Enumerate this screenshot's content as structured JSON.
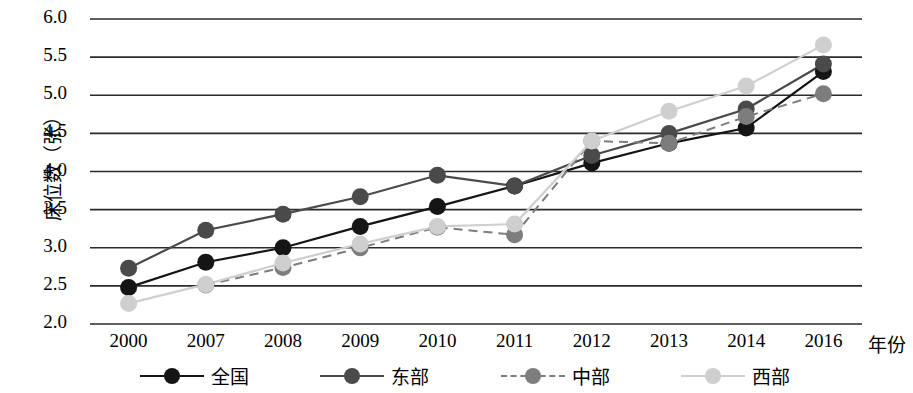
{
  "chart_data": {
    "type": "line",
    "title": "",
    "xlabel": "年份",
    "ylabel": "床位数（张）",
    "categories": [
      "2000",
      "2007",
      "2008",
      "2009",
      "2010",
      "2011",
      "2012",
      "2013",
      "2014",
      "2016"
    ],
    "ylim": [
      2.0,
      6.0
    ],
    "yticks": [
      "2.0",
      "2.5",
      "3.0",
      "3.5",
      "4.0",
      "4.5",
      "5.0",
      "5.5",
      "6.0"
    ],
    "grid": "horizontal",
    "legend_position": "bottom",
    "series": [
      {
        "name": "全国",
        "color": "#151515",
        "style": "solid",
        "values": [
          2.48,
          2.81,
          3.0,
          3.28,
          3.54,
          3.81,
          4.11,
          4.37,
          4.57,
          5.31
        ]
      },
      {
        "name": "东部",
        "color": "#4a4a4a",
        "style": "solid",
        "values": [
          2.73,
          3.23,
          3.44,
          3.67,
          3.95,
          3.81,
          4.21,
          4.5,
          4.82,
          5.41
        ]
      },
      {
        "name": "中部",
        "color": "#7d7d7d",
        "style": "dashed",
        "values": [
          null,
          2.51,
          2.74,
          3.0,
          3.27,
          3.17,
          4.4,
          4.37,
          4.72,
          5.02
        ]
      },
      {
        "name": "西部",
        "color": "#cfcfcf",
        "style": "solid",
        "values": [
          2.27,
          2.52,
          2.8,
          3.05,
          3.28,
          3.31,
          4.4,
          4.79,
          5.12,
          5.66
        ]
      }
    ]
  },
  "axes": {
    "y_title": "床位数（张）",
    "x_title": "年份"
  },
  "legend": {
    "items": [
      {
        "label": "全国"
      },
      {
        "label": "东部"
      },
      {
        "label": "中部"
      },
      {
        "label": "西部"
      }
    ]
  }
}
